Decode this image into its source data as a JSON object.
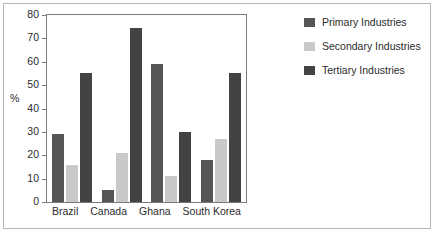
{
  "chart_data": {
    "type": "bar",
    "title": "",
    "subtitle": "",
    "xlabel": "",
    "ylabel": "%",
    "ylim": [
      0,
      80
    ],
    "yticks": [
      0,
      10,
      20,
      30,
      40,
      50,
      60,
      70,
      80
    ],
    "ytick_labels": [
      "0",
      "10",
      "20",
      "30",
      "40",
      "50",
      "60",
      "70",
      "80"
    ],
    "grid": false,
    "legend_position": "right",
    "categories": [
      "Brazil",
      "Canada",
      "Ghana",
      "South Korea"
    ],
    "series": [
      {
        "name": "Primary Industries",
        "color": "#555555",
        "values": [
          29,
          5,
          59,
          18
        ]
      },
      {
        "name": "Secondary Industries",
        "color": "#c9c9c9",
        "values": [
          16,
          21,
          11,
          27
        ]
      },
      {
        "name": "Tertiary Industries",
        "color": "#434343",
        "values": [
          55,
          74.5,
          30,
          55
        ]
      }
    ]
  },
  "legend": {
    "items": [
      {
        "label": "Primary Industries",
        "color": "#555555"
      },
      {
        "label": "Secondary Industries",
        "color": "#c9c9c9"
      },
      {
        "label": "Tertiary Industries",
        "color": "#434343"
      }
    ]
  }
}
